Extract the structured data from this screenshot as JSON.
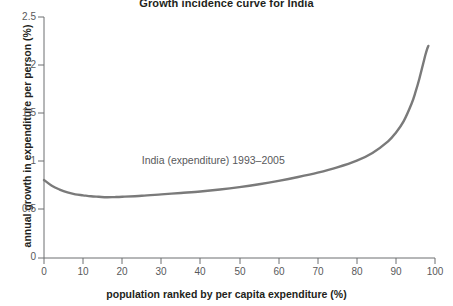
{
  "chart_data": {
    "type": "line",
    "title": "Growth incidence curve for India",
    "xlabel": "population ranked by per capita expenditure (%)",
    "ylabel": "annual growth in expenditure per person (%)",
    "xlim": [
      0,
      100
    ],
    "ylim": [
      0,
      2.5
    ],
    "xticks": [
      "0",
      "10",
      "20",
      "30",
      "40",
      "50",
      "60",
      "70",
      "80",
      "90",
      "100"
    ],
    "yticks": [
      "0",
      "0.5",
      "1",
      "1.5",
      "2",
      "2.5"
    ],
    "grid": false,
    "legend_position": "inline-annotation",
    "annotations": [
      {
        "text": "India (expenditure) 1993–2005",
        "x": 25,
        "y": 1.01
      }
    ],
    "series": [
      {
        "name": "India (expenditure) 1993–2005",
        "color": "#7a7a7a",
        "x": [
          0,
          2,
          4,
          6,
          8,
          10,
          12,
          14,
          16,
          18,
          20,
          25,
          30,
          35,
          40,
          45,
          50,
          55,
          60,
          65,
          70,
          75,
          80,
          84,
          88,
          90,
          92,
          94,
          95,
          96,
          97,
          97.5,
          98,
          98.3
        ],
        "y": [
          0.81,
          0.75,
          0.71,
          0.68,
          0.66,
          0.65,
          0.64,
          0.635,
          0.63,
          0.632,
          0.635,
          0.645,
          0.66,
          0.675,
          0.69,
          0.71,
          0.735,
          0.765,
          0.8,
          0.84,
          0.885,
          0.94,
          1.01,
          1.09,
          1.21,
          1.3,
          1.42,
          1.6,
          1.72,
          1.86,
          2.02,
          2.1,
          2.17,
          2.2
        ]
      }
    ]
  },
  "axes_geometry": {
    "plot_left_px": 44,
    "plot_right_px": 435,
    "plot_top_px": 17,
    "plot_bottom_px": 258
  }
}
